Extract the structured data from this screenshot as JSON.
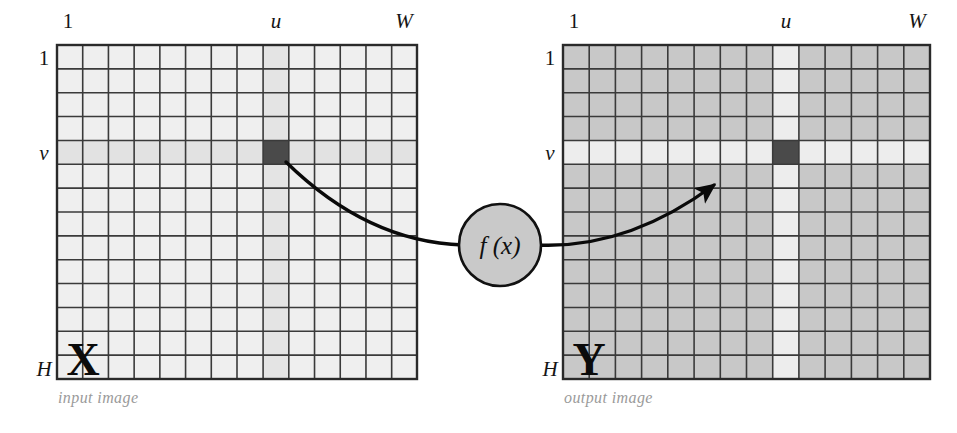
{
  "figure": {
    "background_color": "#ffffff"
  },
  "colors": {
    "input_cell_fill": "#efefef",
    "input_highlight_fill": "#e2e2e2",
    "output_cell_fill": "#c8c8c8",
    "output_highlight_fill": "#ededed",
    "selected_cell_fill": "#4a4a4a",
    "grid_line": "#3a3a3a",
    "grid_border": "#2a2a2a",
    "curve_stroke": "#0a0a0a",
    "node_fill": "#c9c9c9",
    "node_stroke": "#111111",
    "label_color": "#151515",
    "caption_color": "#9a9a9a"
  },
  "grid": {
    "columns": 14,
    "rows": 14,
    "u_column_index": 8,
    "v_row_index": 4
  },
  "input_panel": {
    "name": "input image",
    "letter": "X",
    "caption": "input image",
    "top_left_label": "1",
    "top_u_label": "u",
    "top_right_label": "W",
    "left_top_label": "1",
    "left_v_label": "v",
    "left_bottom_label": "H"
  },
  "output_panel": {
    "name": "output image",
    "letter": "Y",
    "caption": "output image",
    "top_left_label": "1",
    "top_u_label": "u",
    "top_right_label": "W",
    "left_top_label": "1",
    "left_v_label": "v",
    "left_bottom_label": "H"
  },
  "mapping_node": {
    "label": "f (x)",
    "shape": "circle"
  }
}
